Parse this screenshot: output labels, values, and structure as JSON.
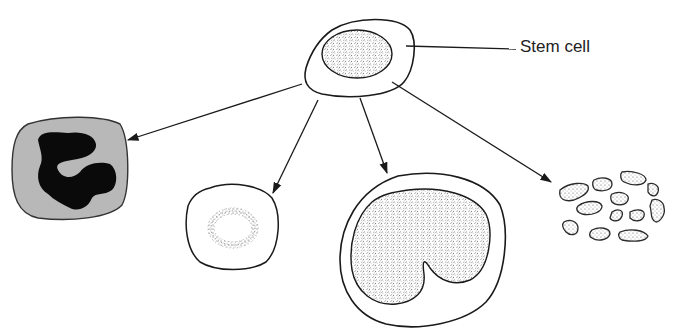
{
  "diagram": {
    "type": "cell-differentiation",
    "labels": {
      "stem_cell": "Stem cell"
    },
    "nodes": [
      {
        "id": "stem-cell",
        "description": "Stem cell with stippled oval nucleus"
      },
      {
        "id": "granulocyte",
        "description": "Gray cell with dark lobed nucleus"
      },
      {
        "id": "small-cell",
        "description": "Clear cell with dotted ring"
      },
      {
        "id": "monocyte",
        "description": "Large cell with kidney-shaped stippled nucleus"
      },
      {
        "id": "platelets",
        "description": "Cluster of small irregular fragments"
      }
    ],
    "edges": [
      {
        "from": "stem-cell",
        "to": "granulocyte"
      },
      {
        "from": "stem-cell",
        "to": "small-cell"
      },
      {
        "from": "stem-cell",
        "to": "monocyte"
      },
      {
        "from": "stem-cell",
        "to": "platelets"
      }
    ],
    "colors": {
      "line": "#1a1a1a",
      "granulocyte_fill": "#b8b8b8",
      "nucleus_dark": "#0a0a0a",
      "stipple": "#555555"
    }
  }
}
